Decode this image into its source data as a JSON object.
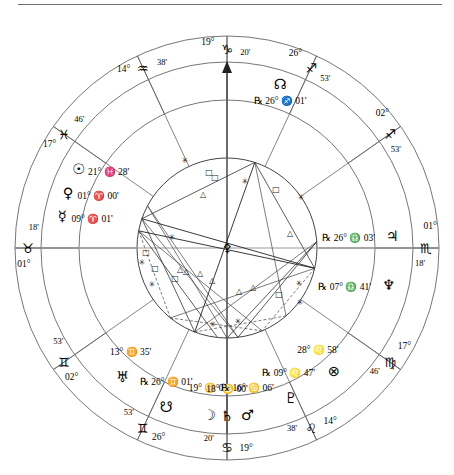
{
  "chart": {
    "type": "astrological-natal-wheel",
    "center": {
      "x": 227,
      "y": 248
    },
    "radii": {
      "outer": 212,
      "sign_ring_inner": 186,
      "house_ring_inner": 148,
      "aspect_circle": 90
    },
    "axes": {
      "mc": {
        "deg": "19°",
        "sign": "♑",
        "min": "20'",
        "label": "19° ♑ 20'"
      },
      "ic": {
        "deg": "19°",
        "sign": "♋",
        "min": "20'",
        "label": "19° ♋ 20'"
      },
      "asc": {
        "deg": "01°",
        "sign": "♉",
        "min": "18'",
        "label": "01° ♉ 18'"
      },
      "dsc": {
        "deg": "01°",
        "sign": "♏",
        "min": "18'",
        "label": "01° ♏ 18'"
      }
    },
    "cusps": [
      {
        "name": "house-1-asc",
        "deg": "01°",
        "sign": "♉",
        "min": "18'",
        "angle": 180
      },
      {
        "name": "house-2",
        "deg": "02°",
        "sign": "♊",
        "min": "53'",
        "angle": 215
      },
      {
        "name": "house-3",
        "deg": "26°",
        "sign": "♊",
        "min": "53'",
        "angle": 245
      },
      {
        "name": "house-4-ic",
        "deg": "19°",
        "sign": "♋",
        "min": "20'",
        "angle": 270
      },
      {
        "name": "house-5",
        "deg": "14°",
        "sign": "♌",
        "min": "38'",
        "angle": 295
      },
      {
        "name": "house-6",
        "deg": "17°",
        "sign": "♍",
        "min": "46'",
        "angle": 325
      },
      {
        "name": "house-7-dsc",
        "deg": "01°",
        "sign": "♏",
        "min": "18'",
        "angle": 0
      },
      {
        "name": "house-8",
        "deg": "02°",
        "sign": "♐",
        "min": "53'",
        "angle": 35
      },
      {
        "name": "house-9",
        "deg": "26°",
        "sign": "♐",
        "min": "53'",
        "angle": 65
      },
      {
        "name": "house-10-mc",
        "deg": "19°",
        "sign": "♑",
        "min": "20'",
        "angle": 90
      },
      {
        "name": "house-11",
        "deg": "14°",
        "sign": "♒",
        "min": "38'",
        "angle": 115
      },
      {
        "name": "house-12",
        "deg": "17°",
        "sign": "♓",
        "min": "46'",
        "angle": 145
      }
    ],
    "planets": [
      {
        "name": "sun",
        "glyph": "☉",
        "deg": "21°",
        "sign": "♓",
        "min": "28'",
        "retro": false
      },
      {
        "name": "venus",
        "glyph": "♀",
        "deg": "01°",
        "sign": "♈",
        "min": "00'",
        "retro": false
      },
      {
        "name": "mercury",
        "glyph": "☿",
        "deg": "09°",
        "sign": "♈",
        "min": "01'",
        "retro": false
      },
      {
        "name": "north-node",
        "glyph": "☊",
        "deg": "26°",
        "sign": "♐",
        "min": "01'",
        "retro": true
      },
      {
        "name": "jupiter",
        "glyph": "♃",
        "deg": "26°",
        "sign": "♎",
        "min": "03'",
        "retro": true
      },
      {
        "name": "neptune",
        "glyph": "♆",
        "deg": "07°",
        "sign": "♎",
        "min": "41'",
        "retro": true
      },
      {
        "name": "part-of-fortune",
        "glyph": "⊗",
        "deg": "28°",
        "sign": "♌",
        "min": "58'",
        "retro": false
      },
      {
        "name": "pluto",
        "glyph": "♇",
        "deg": "09°",
        "sign": "♌",
        "min": "47'",
        "retro": true
      },
      {
        "name": "moon",
        "glyph": "☽",
        "deg": "19°",
        "sign": "♋",
        "min": "08'",
        "retro": false
      },
      {
        "name": "saturn",
        "glyph": "♄",
        "deg": "18°",
        "sign": "♋",
        "min": "00'",
        "retro": false
      },
      {
        "name": "mars",
        "glyph": "♂",
        "deg": "16°",
        "sign": "♋",
        "min": "06'",
        "retro": true
      },
      {
        "name": "south-node",
        "glyph": "☋",
        "deg": "26°",
        "sign": "♊",
        "min": "01'",
        "retro": true
      },
      {
        "name": "uranus",
        "glyph": "♅",
        "deg": "13°",
        "sign": "♊",
        "min": "35'",
        "retro": false
      }
    ],
    "sign_ring_glyphs": [
      {
        "name": "aries",
        "glyph": "♈",
        "angle": 164
      },
      {
        "name": "taurus",
        "glyph": "♉",
        "angle": 188
      },
      {
        "name": "scorpio",
        "glyph": "♏",
        "angle": 356
      },
      {
        "name": "libra",
        "glyph": "♎",
        "angle": 338
      },
      {
        "name": "virgo",
        "glyph": "♍",
        "angle": 322
      },
      {
        "name": "leo",
        "glyph": "♌",
        "angle": 296
      },
      {
        "name": "cancer",
        "glyph": "♋",
        "angle": 272
      },
      {
        "name": "gemini",
        "glyph": "♊",
        "angle": 243
      },
      {
        "name": "gemini2",
        "glyph": "♊",
        "angle": 216
      },
      {
        "name": "pisces",
        "glyph": "♓",
        "angle": 146
      },
      {
        "name": "aquarius",
        "glyph": "♒",
        "angle": 117
      },
      {
        "name": "sagittarius",
        "glyph": "♐",
        "angle": 66
      },
      {
        "name": "sagittarius2",
        "glyph": "♐",
        "angle": 36
      },
      {
        "name": "capricorn",
        "glyph": "♑",
        "angle": 91
      }
    ],
    "aspect_symbols": [
      {
        "name": "sextile",
        "glyph": "✳",
        "x": 185,
        "y": 163
      },
      {
        "name": "square",
        "glyph": "□",
        "x": 209,
        "y": 175
      },
      {
        "name": "square",
        "glyph": "□",
        "x": 215,
        "y": 180
      },
      {
        "name": "trine",
        "glyph": "△",
        "x": 203,
        "y": 197
      },
      {
        "name": "square",
        "glyph": "□",
        "x": 276,
        "y": 192
      },
      {
        "name": "sextile",
        "glyph": "✳",
        "x": 301,
        "y": 200
      },
      {
        "name": "trine",
        "glyph": "△",
        "x": 290,
        "y": 236
      },
      {
        "name": "square",
        "glyph": "□",
        "x": 146,
        "y": 255
      },
      {
        "name": "sextile",
        "glyph": "✳",
        "x": 142,
        "y": 265
      },
      {
        "name": "square",
        "glyph": "□",
        "x": 155,
        "y": 271
      },
      {
        "name": "sextile",
        "glyph": "✳",
        "x": 152,
        "y": 287
      },
      {
        "name": "trine",
        "glyph": "△",
        "x": 180,
        "y": 272
      },
      {
        "name": "trine",
        "glyph": "△",
        "x": 186,
        "y": 274
      },
      {
        "name": "trine",
        "glyph": "△",
        "x": 200,
        "y": 276
      },
      {
        "name": "square",
        "glyph": "□",
        "x": 175,
        "y": 281
      },
      {
        "name": "trine",
        "glyph": "△",
        "x": 212,
        "y": 283
      },
      {
        "name": "trine",
        "glyph": "△",
        "x": 239,
        "y": 294
      },
      {
        "name": "trine",
        "glyph": "△",
        "x": 253,
        "y": 290
      },
      {
        "name": "square",
        "glyph": "□",
        "x": 279,
        "y": 297
      },
      {
        "name": "sextile",
        "glyph": "✳",
        "x": 299,
        "y": 286
      },
      {
        "name": "sextile",
        "glyph": "✳",
        "x": 300,
        "y": 305
      },
      {
        "name": "sextile",
        "glyph": "✳",
        "x": 213,
        "y": 327
      },
      {
        "name": "sextile",
        "glyph": "✳",
        "x": 238,
        "y": 324
      },
      {
        "name": "sextile",
        "glyph": "✳",
        "x": 172,
        "y": 240
      },
      {
        "name": "sextile",
        "glyph": "✳",
        "x": 245,
        "y": 184
      }
    ],
    "center_glyph": {
      "name": "earth-center-marker",
      "glyph": "⚴"
    }
  }
}
